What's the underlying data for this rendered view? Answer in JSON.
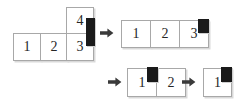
{
  "diagram": {
    "colors": {
      "cell_border": "#a8a8a8",
      "cell_fill": "#ffffff",
      "marker": "#1a1a1a",
      "shadow": "#d9d9d9",
      "arrow": "#3a3a3a",
      "text": "#262626"
    },
    "steps": [
      {
        "id": "step-1",
        "name": "l-shape-group",
        "cells": [
          {
            "label": "1"
          },
          {
            "label": "2"
          },
          {
            "label": "3"
          },
          {
            "label": "4"
          }
        ],
        "marker": {
          "orientation": "vertical",
          "position": "right-edge-spanning-4-and-3"
        }
      },
      {
        "id": "step-2",
        "name": "row-of-three-group",
        "cells": [
          {
            "label": "1"
          },
          {
            "label": "2"
          },
          {
            "label": "3"
          }
        ],
        "marker": {
          "orientation": "square",
          "position": "top-right-of-cell-3"
        }
      },
      {
        "id": "step-3",
        "name": "row-of-two-group",
        "cells": [
          {
            "label": "1"
          },
          {
            "label": "2"
          }
        ],
        "marker": {
          "orientation": "square",
          "position": "top-between-cell-1-and-2"
        }
      },
      {
        "id": "step-4",
        "name": "single-cell-group",
        "cells": [
          {
            "label": "1"
          }
        ],
        "marker": {
          "orientation": "square",
          "position": "top-right-of-cell-1"
        }
      }
    ],
    "arrows": [
      {
        "id": "arrow-1",
        "direction": "right",
        "glyph": "right-arrow"
      },
      {
        "id": "arrow-2",
        "direction": "right",
        "glyph": "right-arrow"
      },
      {
        "id": "arrow-3",
        "direction": "right",
        "glyph": "right-arrow"
      }
    ]
  }
}
